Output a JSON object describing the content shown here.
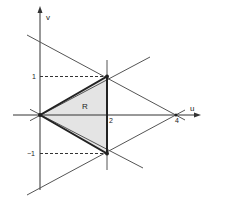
{
  "diagram": {
    "axes": {
      "x_label": "u",
      "y_label": "v"
    },
    "ticks": {
      "u_2": "2",
      "u_4": "4",
      "v_1": "1",
      "v_neg1": "−1"
    },
    "region": {
      "label": "R",
      "vertices": [
        [
          0,
          0
        ],
        [
          2,
          1
        ],
        [
          2,
          -1
        ]
      ],
      "fill": "#e4e4e4"
    },
    "lines": [
      {
        "name": "v = u/2",
        "slope": 0.5,
        "intercept": 0
      },
      {
        "name": "v = -u/2",
        "slope": -0.5,
        "intercept": 0
      },
      {
        "name": "v = 2 - u/2",
        "slope": -0.5,
        "intercept": 2
      },
      {
        "name": "v = u/2 - 2",
        "slope": 0.5,
        "intercept": -2
      },
      {
        "name": "u = 2",
        "vertical": true,
        "u": 2
      }
    ],
    "colors": {
      "line": "#444444",
      "edge": "#222222",
      "dashed": "#333333"
    }
  }
}
